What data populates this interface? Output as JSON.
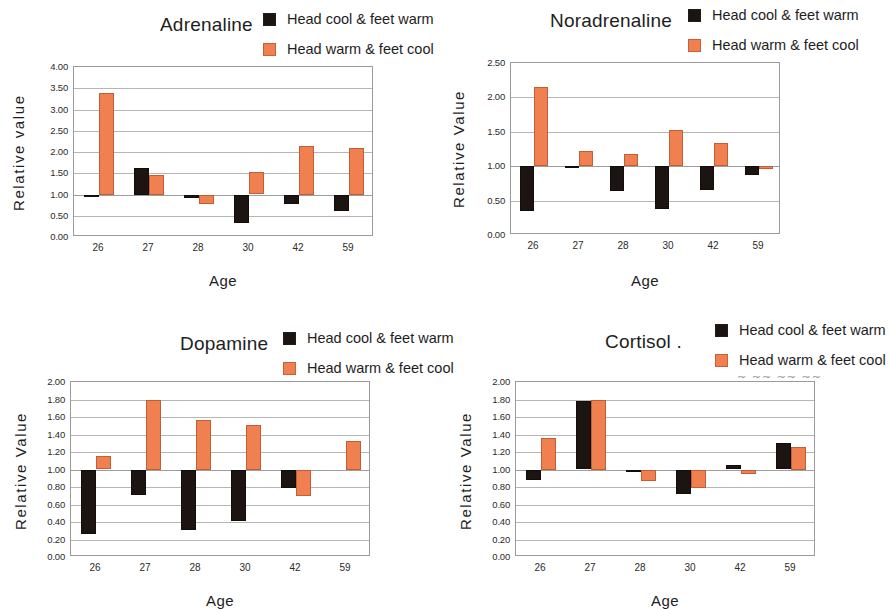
{
  "figure": {
    "background": "#ffffff",
    "series_colors": {
      "head_cool_feet_warm": "#1b1411",
      "head_warm_feet_cool": "#f0804f"
    },
    "legend_labels": [
      "Head cool & feet warm",
      "Head warm & feet cool"
    ],
    "artifact_text": "~ ~~ ~~ ~~"
  },
  "chart_data": [
    {
      "id": "adrenaline",
      "type": "bar",
      "title": "Adrenaline",
      "xlabel": "Age",
      "ylabel": "Relative value",
      "categories": [
        "26",
        "27",
        "28",
        "30",
        "42",
        "59"
      ],
      "ylim": [
        0.0,
        4.0
      ],
      "yticks": [
        "0.00",
        "0.50",
        "1.00",
        "1.50",
        "2.00",
        "2.50",
        "3.00",
        "3.50",
        "4.00"
      ],
      "ytick_values": [
        0.0,
        0.5,
        1.0,
        1.5,
        2.0,
        2.5,
        3.0,
        3.5,
        4.0
      ],
      "baseline": 1.0,
      "grid": true,
      "legend_position": "top-right",
      "series": [
        {
          "name": "Head cool & feet warm",
          "color": "#1b1411",
          "values": [
            1.0,
            1.63,
            0.93,
            0.33,
            0.78,
            0.63
          ]
        },
        {
          "name": "Head warm & feet cool",
          "color": "#f0804f",
          "values": [
            3.4,
            1.47,
            0.8,
            1.52,
            2.15,
            2.1
          ]
        }
      ]
    },
    {
      "id": "noradrenaline",
      "type": "bar",
      "title": "Noradrenaline",
      "xlabel": "Age",
      "ylabel": "Relative Value",
      "categories": [
        "26",
        "27",
        "28",
        "30",
        "42",
        "59"
      ],
      "ylim": [
        0.0,
        2.5
      ],
      "yticks": [
        "0.00",
        "0.50",
        "1.00",
        "1.50",
        "2.00",
        "2.50"
      ],
      "ytick_values": [
        0.0,
        0.5,
        1.0,
        1.5,
        2.0,
        2.5
      ],
      "baseline": 1.0,
      "grid": true,
      "legend_position": "top-right",
      "series": [
        {
          "name": "Head cool & feet warm",
          "color": "#1b1411",
          "values": [
            0.34,
            0.97,
            0.63,
            0.38,
            0.65,
            0.87
          ]
        },
        {
          "name": "Head warm & feet cool",
          "color": "#f0804f",
          "values": [
            2.15,
            1.22,
            1.18,
            1.53,
            1.33,
            0.95
          ]
        }
      ]
    },
    {
      "id": "dopamine",
      "type": "bar",
      "title": "Dopamine",
      "xlabel": "Age",
      "ylabel": "Relative Value",
      "categories": [
        "26",
        "27",
        "28",
        "30",
        "42",
        "59"
      ],
      "ylim": [
        0.0,
        2.0
      ],
      "yticks": [
        "0.00",
        "0.20",
        "0.40",
        "0.60",
        "0.80",
        "1.00",
        "1.20",
        "1.40",
        "1.60",
        "1.80",
        "2.00"
      ],
      "ytick_values": [
        0.0,
        0.2,
        0.4,
        0.6,
        0.8,
        1.0,
        1.2,
        1.4,
        1.6,
        1.8,
        2.0
      ],
      "baseline": 1.0,
      "grid": true,
      "legend_position": "top-right",
      "series": [
        {
          "name": "Head cool & feet warm",
          "color": "#1b1411",
          "values": [
            0.27,
            0.71,
            0.32,
            0.42,
            0.79,
            null
          ]
        },
        {
          "name": "Head warm & feet cool",
          "color": "#f0804f",
          "values": [
            1.15,
            1.8,
            1.57,
            1.51,
            0.7,
            1.33
          ]
        }
      ]
    },
    {
      "id": "cortisol",
      "type": "bar",
      "title": "Cortisol .",
      "xlabel": "Age",
      "ylabel": "Relative Value",
      "categories": [
        "26",
        "27",
        "28",
        "30",
        "42",
        "59"
      ],
      "ylim": [
        0.0,
        2.0
      ],
      "yticks": [
        "0.00",
        "0.20",
        "0.40",
        "0.60",
        "0.80",
        "1.00",
        "1.20",
        "1.40",
        "1.60",
        "1.80",
        "2.00"
      ],
      "ytick_values": [
        0.0,
        0.2,
        0.4,
        0.6,
        0.8,
        1.0,
        1.2,
        1.4,
        1.6,
        1.8,
        2.0
      ],
      "baseline": 1.0,
      "grid": true,
      "legend_position": "top-right",
      "series": [
        {
          "name": "Head cool & feet warm",
          "color": "#1b1411",
          "values": [
            0.89,
            1.78,
            1.0,
            0.73,
            1.05,
            1.3
          ]
        },
        {
          "name": "Head warm & feet cool",
          "color": "#f0804f",
          "values": [
            1.36,
            1.8,
            0.87,
            0.8,
            0.95,
            1.26
          ]
        }
      ]
    }
  ]
}
